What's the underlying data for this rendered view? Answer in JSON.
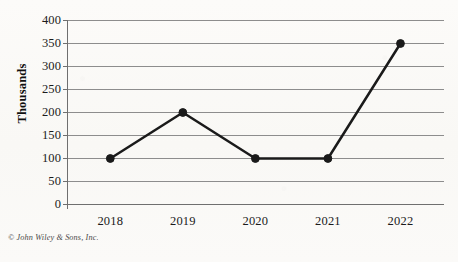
{
  "credit": "© John Wiley & Sons, Inc.",
  "axis": {
    "ylabel": "Thousands"
  },
  "chart_data": {
    "type": "line",
    "title": "",
    "xlabel": "",
    "ylabel": "Thousands",
    "categories": [
      "2018",
      "2019",
      "2020",
      "2021",
      "2022"
    ],
    "values": [
      100,
      200,
      100,
      100,
      350
    ],
    "ylim": [
      0,
      400
    ],
    "ytick_values": [
      0,
      50,
      100,
      150,
      200,
      250,
      300,
      350,
      400
    ],
    "ytick_labels": [
      "0",
      "50",
      "100",
      "150",
      "200",
      "250",
      "300",
      "350",
      "400"
    ],
    "grid": true,
    "grid_axis": "y",
    "legend": false,
    "legend_position": "none",
    "marker": "circle",
    "line_color": "#1a1a1a",
    "marker_color": "#1a1a1a",
    "grid_color": "#8d8d8d",
    "axis_color": "#6f6f6f",
    "background_color": "#fbfaf8"
  }
}
